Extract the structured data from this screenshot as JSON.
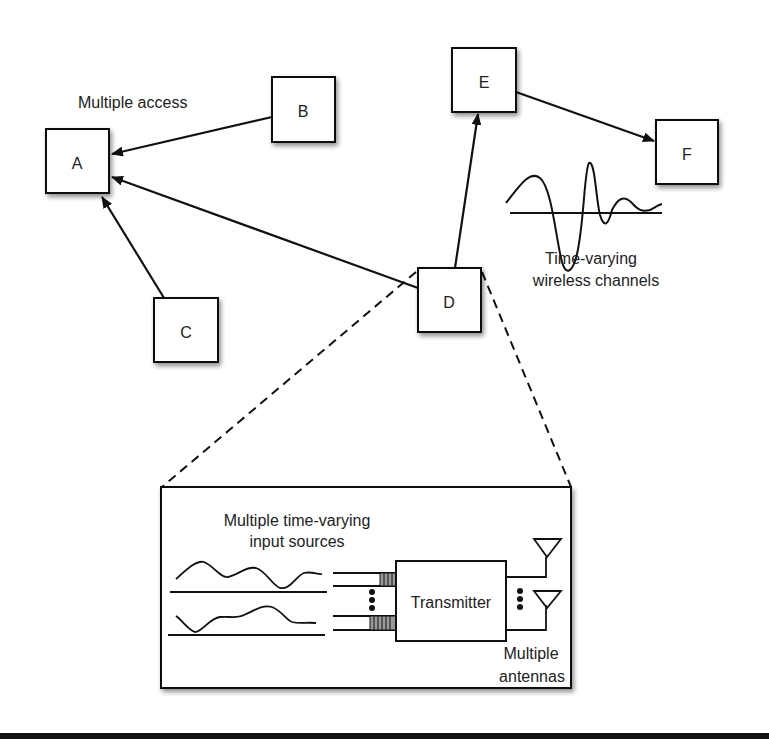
{
  "diagram": {
    "nodes": [
      {
        "id": "A",
        "label": "A"
      },
      {
        "id": "B",
        "label": "B"
      },
      {
        "id": "C",
        "label": "C"
      },
      {
        "id": "D",
        "label": "D"
      },
      {
        "id": "E",
        "label": "E"
      },
      {
        "id": "F",
        "label": "F"
      }
    ],
    "edges": [
      {
        "from": "B",
        "to": "A"
      },
      {
        "from": "C",
        "to": "A"
      },
      {
        "from": "D",
        "to": "A"
      },
      {
        "from": "D",
        "to": "E"
      },
      {
        "from": "E",
        "to": "F"
      }
    ],
    "annotations": {
      "multiple_access": "Multiple access",
      "channel_line1": "Time-varying",
      "channel_line2": "wireless channels"
    },
    "inset": {
      "title_line1": "Multiple time-varying",
      "title_line2": "input sources",
      "transmitter_label": "Transmitter",
      "antennas_line1": "Multiple",
      "antennas_line2": "antennas"
    }
  }
}
